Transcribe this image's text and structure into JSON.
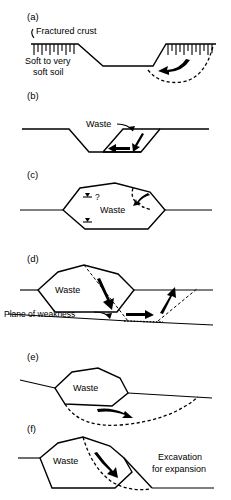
{
  "figure": {
    "panels": [
      {
        "id": "a",
        "label": "(a)",
        "labels": [
          {
            "name": "fractured-crust-label",
            "text": "Fractured crust"
          },
          {
            "name": "soft-soil-label-line1",
            "text": "Soft to very"
          },
          {
            "name": "soft-soil-label-line2",
            "text": "soft soil"
          }
        ]
      },
      {
        "id": "b",
        "label": "(b)",
        "labels": [
          {
            "name": "waste-label",
            "text": "Waste"
          }
        ]
      },
      {
        "id": "c",
        "label": "(c)",
        "labels": [
          {
            "name": "waste-label",
            "text": "Waste"
          },
          {
            "name": "question-mark",
            "text": "?"
          }
        ]
      },
      {
        "id": "d",
        "label": "(d)",
        "labels": [
          {
            "name": "waste-label",
            "text": "Waste"
          },
          {
            "name": "plane-of-weakness-label",
            "text": "Plane of weakness"
          }
        ]
      },
      {
        "id": "e",
        "label": "(e)",
        "labels": [
          {
            "name": "waste-label",
            "text": "Waste"
          }
        ]
      },
      {
        "id": "f",
        "label": "(f)",
        "labels": [
          {
            "name": "waste-label",
            "text": "Waste"
          },
          {
            "name": "excavation-label-line1",
            "text": "Excavation"
          },
          {
            "name": "excavation-label-line2",
            "text": "for expansion"
          }
        ]
      }
    ],
    "colors": {
      "ink": "#000000",
      "background": "#ffffff"
    }
  },
  "text": {
    "panel_a": {
      "label": "(a)",
      "fractured_crust": "Fractured crust",
      "soft_soil_1": "Soft to very",
      "soft_soil_2": "soft soil"
    },
    "panel_b": {
      "label": "(b)",
      "waste": "Waste"
    },
    "panel_c": {
      "label": "(c)",
      "waste": "Waste",
      "query": "?"
    },
    "panel_d": {
      "label": "(d)",
      "waste": "Waste",
      "plane_of_weakness": "Plane of weakness"
    },
    "panel_e": {
      "label": "(e)",
      "waste": "Waste"
    },
    "panel_f": {
      "label": "(f)",
      "waste": "Waste",
      "excavation_1": "Excavation",
      "excavation_2": "for expansion"
    }
  }
}
